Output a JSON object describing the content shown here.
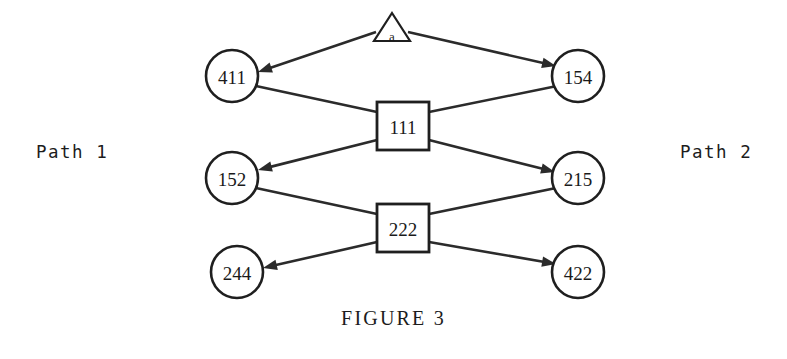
{
  "figure": {
    "caption": "FIGURE 3",
    "left_label": "Path 1",
    "right_label": "Path 2",
    "background_color": "#ffffff",
    "ink_color": "#1f1f1f"
  },
  "nodes": {
    "source": {
      "id": "a",
      "label": "a",
      "shape": "triangle",
      "cx": 392,
      "cy": 30
    },
    "n411": {
      "id": "411",
      "label": "411",
      "shape": "circle",
      "cx": 232,
      "cy": 76,
      "r": 26
    },
    "n154": {
      "id": "154",
      "label": "154",
      "shape": "circle",
      "cx": 578,
      "cy": 76,
      "r": 26
    },
    "n111": {
      "id": "111",
      "label": "111",
      "shape": "box",
      "cx": 403,
      "cy": 126,
      "w": 52,
      "h": 48
    },
    "n152": {
      "id": "152",
      "label": "152",
      "shape": "circle",
      "cx": 232,
      "cy": 178,
      "r": 26
    },
    "n215": {
      "id": "215",
      "label": "215",
      "shape": "circle",
      "cx": 578,
      "cy": 178,
      "r": 26
    },
    "n222": {
      "id": "222",
      "label": "222",
      "shape": "box",
      "cx": 403,
      "cy": 228,
      "w": 52,
      "h": 48
    },
    "n244": {
      "id": "244",
      "label": "244",
      "shape": "circle",
      "cx": 237,
      "cy": 272,
      "r": 26
    },
    "n422": {
      "id": "422",
      "label": "422",
      "shape": "circle",
      "cx": 578,
      "cy": 272,
      "r": 26
    }
  },
  "edges": [
    {
      "name": "edge-a-to-411",
      "from": "a",
      "to": "411",
      "arrow": true,
      "x1": 376,
      "y1": 32,
      "x2": 258,
      "y2": 72
    },
    {
      "name": "edge-a-to-154",
      "from": "a",
      "to": "154",
      "arrow": true,
      "x1": 408,
      "y1": 32,
      "x2": 556,
      "y2": 66
    },
    {
      "name": "edge-411-to-111",
      "from": "411",
      "to": "111",
      "arrow": false,
      "x1": 256,
      "y1": 86,
      "x2": 377,
      "y2": 112
    },
    {
      "name": "edge-111-to-154",
      "from": "111",
      "to": "154",
      "arrow": false,
      "x1": 429,
      "y1": 112,
      "x2": 557,
      "y2": 86
    },
    {
      "name": "edge-111-to-152",
      "from": "111",
      "to": "152",
      "arrow": true,
      "x1": 377,
      "y1": 140,
      "x2": 258,
      "y2": 170
    },
    {
      "name": "edge-111-to-215",
      "from": "111",
      "to": "215",
      "arrow": true,
      "x1": 429,
      "y1": 140,
      "x2": 555,
      "y2": 172
    },
    {
      "name": "edge-152-to-222",
      "from": "152",
      "to": "222",
      "arrow": false,
      "x1": 256,
      "y1": 188,
      "x2": 377,
      "y2": 214
    },
    {
      "name": "edge-222-to-215",
      "from": "222",
      "to": "215",
      "arrow": false,
      "x1": 429,
      "y1": 214,
      "x2": 556,
      "y2": 188
    },
    {
      "name": "edge-222-to-244",
      "from": "222",
      "to": "244",
      "arrow": true,
      "x1": 377,
      "y1": 242,
      "x2": 263,
      "y2": 268
    },
    {
      "name": "edge-222-to-422",
      "from": "222",
      "to": "422",
      "arrow": true,
      "x1": 429,
      "y1": 242,
      "x2": 556,
      "y2": 264
    }
  ]
}
